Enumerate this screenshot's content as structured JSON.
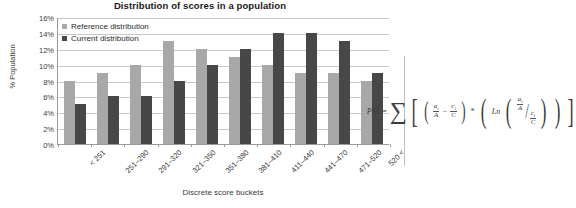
{
  "chart_data": {
    "type": "bar",
    "title": "Distribution of scores in a population",
    "xlabel": "Discrete score buckets",
    "ylabel": "% Population",
    "categories": [
      "< 251",
      "251–290",
      "291–320",
      "321–350",
      "351–380",
      "381–410",
      "411–440",
      "441–470",
      "471–520",
      "520 <"
    ],
    "series": [
      {
        "name": "Reference distribution",
        "color": "#a8a8a8",
        "values": [
          8,
          9,
          10,
          13,
          12,
          11,
          10,
          9,
          9,
          8
        ]
      },
      {
        "name": "Current distribution",
        "color": "#474747",
        "values": [
          5,
          6,
          6,
          8,
          10,
          12,
          14,
          14,
          13,
          9
        ]
      }
    ],
    "ylim": [
      0,
      16
    ],
    "ytick_labels": [
      "16%",
      "14%",
      "12%",
      "10%",
      "8%",
      "6%",
      "4%",
      "2%",
      "0%"
    ],
    "ytick_values": [
      16,
      14,
      12,
      10,
      8,
      6,
      4,
      2,
      0
    ],
    "ytick_step": 2,
    "grid": true,
    "legend_position": "top-left"
  },
  "formula": {
    "name": "PSI",
    "equals": "=",
    "sigma": "∑",
    "minus": "−",
    "times": "*",
    "ln": "Ln",
    "a_num": "a",
    "a_sub": "i",
    "A_den": "A",
    "c_num": "c",
    "c_sub": "i",
    "C_den": "C",
    "bracket_open": "[",
    "bracket_close": "]",
    "paren_open": "(",
    "paren_close": ")",
    "slash": "/"
  }
}
